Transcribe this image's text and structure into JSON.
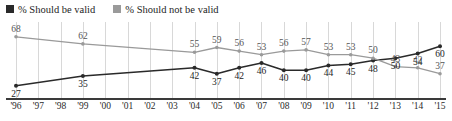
{
  "legend": {
    "position": "top-left",
    "items": [
      {
        "label": "% Should be valid",
        "color": "#2a2a2a",
        "marker": "legend-swatch-black"
      },
      {
        "label": "% Should not be valid",
        "color": "#9a9a9a",
        "marker": "legend-swatch-gray"
      }
    ]
  },
  "chart_data": {
    "type": "line",
    "title": "",
    "xlabel": "",
    "ylabel": "",
    "ylim": [
      20,
      72
    ],
    "grid": "vertical",
    "legend_position": "top-left",
    "categories": [
      "'96",
      "'97",
      "'98",
      "'99",
      "'00",
      "'01",
      "'02",
      "'03",
      "'04",
      "'05",
      "'06",
      "'07",
      "'08",
      "'09",
      "'10",
      "'11",
      "'12",
      "'13",
      "'14",
      "'15"
    ],
    "series": [
      {
        "name": "% Should be valid",
        "color": "#2a2a2a",
        "values": [
          27,
          null,
          null,
          35,
          null,
          null,
          null,
          null,
          42,
          37,
          42,
          46,
          40,
          40,
          44,
          45,
          48,
          50,
          54,
          60
        ],
        "labels": [
          "27",
          null,
          null,
          "35",
          null,
          null,
          null,
          null,
          "42",
          "37",
          "42",
          "46",
          "40",
          "40",
          "44",
          "45",
          "48",
          "50",
          "54",
          "60"
        ]
      },
      {
        "name": "% Should not be valid",
        "color": "#9a9a9a",
        "values": [
          68,
          null,
          null,
          62,
          null,
          null,
          null,
          null,
          55,
          59,
          56,
          53,
          56,
          57,
          53,
          53,
          50,
          43,
          42,
          37
        ],
        "labels": [
          "68",
          null,
          null,
          "62",
          null,
          null,
          null,
          null,
          "55",
          "59",
          "56",
          "53",
          "56",
          "57",
          "53",
          "53",
          "50",
          "43",
          "42",
          "37"
        ]
      }
    ]
  },
  "colors": {
    "series_black": "#2a2a2a",
    "series_gray": "#9a9a9a",
    "gridline": "#d8d8d8",
    "axis": "#3a3a3a",
    "label_text": "#2b2b2b"
  }
}
